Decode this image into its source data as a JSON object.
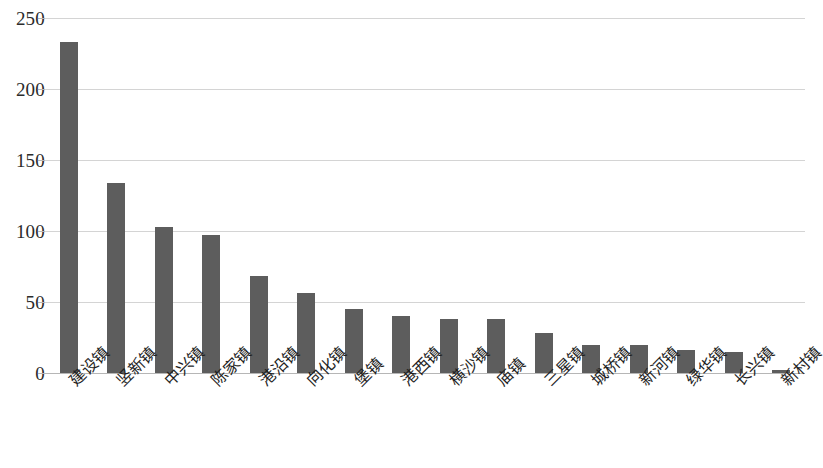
{
  "chart_data": {
    "type": "bar",
    "title": "",
    "subtitle": "",
    "xlabel": "",
    "ylabel": "",
    "ylim": [
      0,
      250
    ],
    "yticks": [
      0,
      50,
      100,
      150,
      200,
      250
    ],
    "ytick_labels": [
      "0",
      "50",
      "100",
      "150",
      "200",
      "250"
    ],
    "grid": true,
    "legend": false,
    "legend_position": "none",
    "bar_color": "#5d5d5d",
    "gridline_color": "#d4d4d4",
    "axis_color": "#b6b6b6",
    "categories": [
      "建设镇",
      "竖新镇",
      "中兴镇",
      "陈家镇",
      "港沿镇",
      "向化镇",
      "堡镇",
      "港西镇",
      "横沙镇",
      "庙镇",
      "三星镇",
      "城桥镇",
      "新河镇",
      "绿华镇",
      "长兴镇",
      "新村镇"
    ],
    "values": [
      233,
      134,
      103,
      97,
      68,
      56,
      45,
      40,
      38,
      38,
      28,
      20,
      20,
      16,
      15,
      2
    ]
  }
}
